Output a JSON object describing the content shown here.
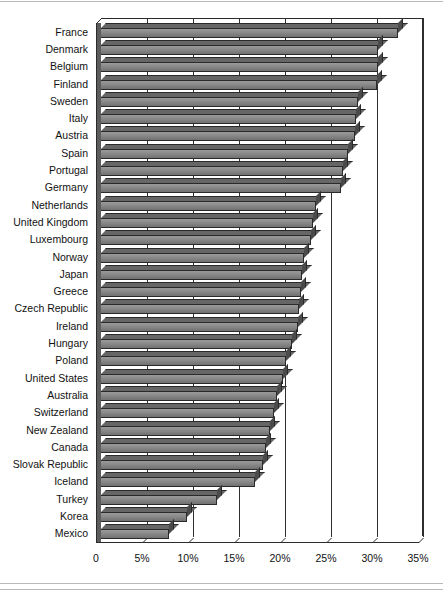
{
  "figure": {
    "title": "",
    "xaxis_label": "",
    "yaxis_label": ""
  },
  "axis": {
    "x_ticks": [
      "0",
      "5%",
      "10%",
      "15%",
      "20%",
      "25%",
      "30%",
      "35%"
    ]
  },
  "chart_data": {
    "type": "bar",
    "orientation": "horizontal",
    "title": "",
    "xlabel": "",
    "ylabel": "",
    "xlim": [
      0,
      35
    ],
    "grid": true,
    "legend": "none",
    "tick_labels": [
      "0",
      "5%",
      "10%",
      "15%",
      "20%",
      "25%",
      "30%",
      "35%"
    ],
    "tick_values": [
      0,
      5,
      10,
      15,
      20,
      25,
      30,
      35
    ],
    "units": "percent",
    "categories": [
      "France",
      "Denmark",
      "Belgium",
      "Finland",
      "Sweden",
      "Italy",
      "Austria",
      "Spain",
      "Portugal",
      "Germany",
      "Netherlands",
      "United Kingdom",
      "Luxembourg",
      "Norway",
      "Japan",
      "Greece",
      "Czech Republic",
      "Ireland",
      "Hungary",
      "Poland",
      "United States",
      "Australia",
      "Switzerland",
      "New Zealand",
      "Canada",
      "Slovak Republic",
      "Iceland",
      "Turkey",
      "Korea",
      "Mexico"
    ],
    "values": [
      32.8,
      30.7,
      30.6,
      30.5,
      28.5,
      28.3,
      28.2,
      27.4,
      26.8,
      26.6,
      23.9,
      23.6,
      23.4,
      22.6,
      22.4,
      22.3,
      22.1,
      22.0,
      21.3,
      20.7,
      20.3,
      19.7,
      19.3,
      18.9,
      18.5,
      18.2,
      17.3,
      13.2,
      9.9,
      7.9
    ]
  }
}
